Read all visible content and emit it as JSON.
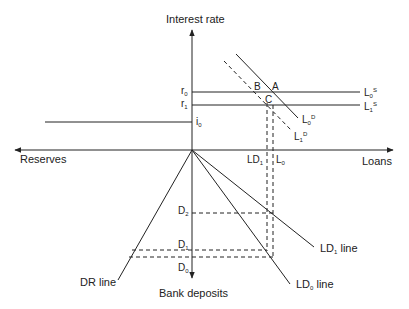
{
  "axes": {
    "y_up_label": "Interest rate",
    "y_down_label": "Bank deposits",
    "x_left_label": "Reserves",
    "x_right_label": "Loans"
  },
  "rate_labels": {
    "r0": {
      "base": "r",
      "sub": "0"
    },
    "r1": {
      "base": "r",
      "sub": "1"
    },
    "i0": {
      "base": "i",
      "sub": "0"
    }
  },
  "points": {
    "A": "A",
    "B": "B",
    "C": "C"
  },
  "curves": {
    "L0S": {
      "base": "L",
      "sub": "0",
      "sup": "S"
    },
    "L1S": {
      "base": "L",
      "sub": "1",
      "sup": "S"
    },
    "L0D": {
      "base": "L",
      "sub": "0",
      "sup": "D"
    },
    "L1D": {
      "base": "L",
      "sub": "1",
      "sup": "D"
    }
  },
  "loan_labels": {
    "LD1": {
      "base": "LD",
      "sub": "1"
    },
    "L0": {
      "base": "L",
      "sub": "0"
    }
  },
  "deposit_labels": {
    "D2": {
      "base": "D",
      "sub": "2"
    },
    "D1": {
      "base": "D",
      "sub": "1"
    },
    "D0": {
      "base": "D",
      "sub": "0"
    }
  },
  "lines": {
    "DR": "DR line",
    "LD1": {
      "base": "LD",
      "sub": "1",
      "rest": " line"
    },
    "LD0": {
      "base": "LD",
      "sub": "0",
      "rest": " line"
    }
  },
  "colors": {
    "ink": "#222222",
    "background": "#ffffff"
  }
}
